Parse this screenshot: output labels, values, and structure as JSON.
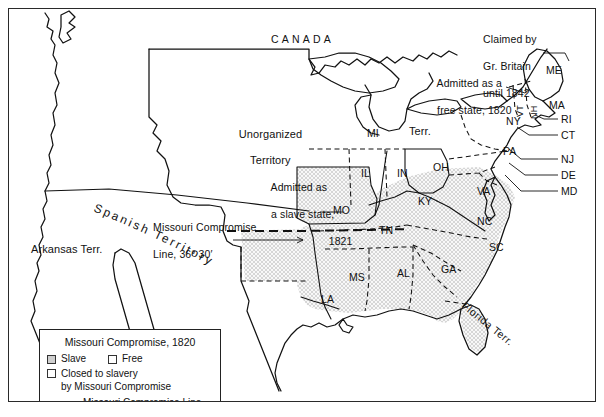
{
  "figure": {
    "type": "historical-map"
  },
  "legend": {
    "title": "Missouri Compromise, 1820",
    "items": [
      {
        "swatch": "slave-shaded",
        "label": "Slave"
      },
      {
        "swatch": "free-white",
        "label": "Free"
      },
      {
        "swatch": "closed-white",
        "label": "Closed to slavery",
        "label_line2": "by Missouri Compromise"
      },
      {
        "swatch": "dashed-line",
        "label": "Missouri Compromise Line"
      }
    ]
  },
  "annotations": [
    {
      "id": "canada",
      "text": "CANADA"
    },
    {
      "id": "claimed-britain",
      "line1": "Claimed by",
      "line2": "Gr. Britain",
      "line3": "until 1842"
    },
    {
      "id": "admitted-free",
      "line1": "Admitted as a",
      "line2": "free state, 1820"
    },
    {
      "id": "admitted-slave",
      "line1": "Admitted as",
      "line2": "a slave state,",
      "line3": "1821"
    },
    {
      "id": "compromise-line",
      "line1": "Missouri Compromise",
      "line2": "Line, 36° 30′"
    },
    {
      "id": "unorganized",
      "line1": "Unorganized",
      "line2": "Territory"
    },
    {
      "id": "spanish",
      "text": "Spanish Territory"
    },
    {
      "id": "arkansas",
      "text": "Arkansas Terr."
    },
    {
      "id": "michigan-terr",
      "part1": "MI",
      "part2": "Terr."
    },
    {
      "id": "florida",
      "text": "Florida Terr."
    }
  ],
  "labels": {
    "canada": "CANADA",
    "unorganized_l1": "Unorganized",
    "unorganized_l2": "Territory",
    "spanish_territory": "Spanish Territory",
    "arkansas_terr": "Arkansas Terr.",
    "florida_terr": "Florida Terr.",
    "mi": "MI",
    "mi_terr": "Terr.",
    "claimed_l1": "Claimed by",
    "claimed_l2": "Gr. Britain",
    "claimed_l3": "until 1842",
    "free_state_l1": "Admitted as a",
    "free_state_l2": "free state, 1820",
    "slave_state_l1": "Admitted as",
    "slave_state_l2": "a slave state,",
    "slave_state_l3": "1821",
    "compromise_l1": "Missouri Compromise",
    "compromise_l2": "Line, 36° 30′"
  },
  "states": [
    {
      "abbr": "ME",
      "status": "free"
    },
    {
      "abbr": "VT",
      "status": "free",
      "orientation": "vertical"
    },
    {
      "abbr": "NH",
      "status": "free",
      "orientation": "vertical"
    },
    {
      "abbr": "MA",
      "status": "free"
    },
    {
      "abbr": "RI",
      "status": "free"
    },
    {
      "abbr": "CT",
      "status": "free"
    },
    {
      "abbr": "NY",
      "status": "free"
    },
    {
      "abbr": "NJ",
      "status": "free"
    },
    {
      "abbr": "PA",
      "status": "free"
    },
    {
      "abbr": "DE",
      "status": "slave"
    },
    {
      "abbr": "MD",
      "status": "slave"
    },
    {
      "abbr": "VA",
      "status": "slave"
    },
    {
      "abbr": "NC",
      "status": "slave"
    },
    {
      "abbr": "SC",
      "status": "slave"
    },
    {
      "abbr": "GA",
      "status": "slave"
    },
    {
      "abbr": "OH",
      "status": "free"
    },
    {
      "abbr": "IN",
      "status": "free"
    },
    {
      "abbr": "IL",
      "status": "free"
    },
    {
      "abbr": "KY",
      "status": "slave"
    },
    {
      "abbr": "TN",
      "status": "slave"
    },
    {
      "abbr": "AL",
      "status": "slave"
    },
    {
      "abbr": "MS",
      "status": "slave"
    },
    {
      "abbr": "LA",
      "status": "slave"
    },
    {
      "abbr": "MO",
      "status": "slave"
    }
  ],
  "colors": {
    "ink": "#111111",
    "shaded_fill": "#cfcfcf",
    "white_fill": "#ffffff",
    "frame": "#2a2a2a"
  }
}
